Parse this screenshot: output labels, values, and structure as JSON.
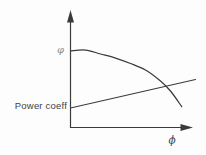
{
  "figure": {
    "y_axis_label": "φ",
    "x_axis_label": "ϕ",
    "power_coeff_label": "Power coeff"
  },
  "colors": {
    "background": "#fdfdfd",
    "line": "#3b3b3b",
    "text": "#3f3f3f",
    "y_axis_label_color": "#8a8a8a"
  },
  "chart_data": {
    "type": "line",
    "title": "",
    "xlabel": "ϕ",
    "ylabel": "φ",
    "grid": false,
    "legend_position": "none",
    "axes_qualitative": true,
    "x_range": [
      0,
      1
    ],
    "y_range": [
      0,
      1
    ],
    "series": [
      {
        "name": "φ",
        "style": "curved",
        "points": [
          [
            0.0,
            0.664
          ],
          [
            0.12,
            0.672
          ],
          [
            0.24,
            0.638
          ],
          [
            0.36,
            0.603
          ],
          [
            0.48,
            0.556
          ],
          [
            0.6,
            0.5
          ],
          [
            0.72,
            0.405
          ],
          [
            0.8,
            0.319
          ],
          [
            0.89,
            0.184
          ]
        ]
      },
      {
        "name": "Power coeff",
        "style": "straight",
        "points": [
          [
            0.0,
            0.172
          ],
          [
            1.0,
            0.418
          ]
        ]
      }
    ],
    "annotations": [
      {
        "text": "φ",
        "position": "left of y-axis at curve start"
      },
      {
        "text": "Power coeff",
        "position": "left of y-axis at straight-line start"
      },
      {
        "text": "ϕ",
        "position": "below x-axis near right arrow"
      }
    ]
  }
}
